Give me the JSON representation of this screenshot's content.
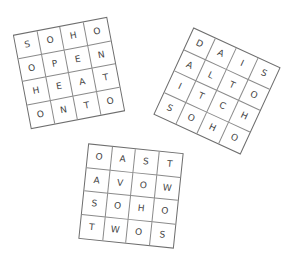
{
  "puzzles": [
    {
      "id": "grid-1",
      "rows": [
        [
          "S",
          "O",
          "H",
          "O"
        ],
        [
          "O",
          "P",
          "E",
          "N"
        ],
        [
          "H",
          "E",
          "A",
          "T"
        ],
        [
          "O",
          "N",
          "T",
          "O"
        ]
      ]
    },
    {
      "id": "grid-2",
      "rows": [
        [
          "D",
          "A",
          "I",
          "S"
        ],
        [
          "A",
          "L",
          "T",
          "O"
        ],
        [
          "I",
          "T",
          "C",
          "H"
        ],
        [
          "S",
          "O",
          "H",
          "O"
        ]
      ]
    },
    {
      "id": "grid-3",
      "rows": [
        [
          "O",
          "A",
          "S",
          "T"
        ],
        [
          "A",
          "V",
          "O",
          "W"
        ],
        [
          "S",
          "O",
          "H",
          "O"
        ],
        [
          "T",
          "W",
          "O",
          "S"
        ]
      ]
    }
  ]
}
